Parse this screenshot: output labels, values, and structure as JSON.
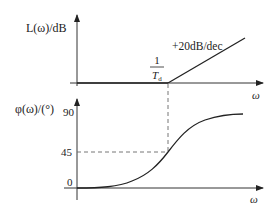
{
  "diagram": {
    "type": "bode-plot",
    "magnitude_plot": {
      "y_label": "L(ω)/dB",
      "x_label": "ω",
      "corner_label_numerator": "1",
      "corner_label_denominator": "T",
      "corner_label_subscript": "d",
      "slope_label": "+20dB/dec"
    },
    "phase_plot": {
      "y_label": "φ(ω)/(°)",
      "x_label": "ω",
      "ticks": [
        "90",
        "45",
        "0"
      ]
    },
    "colors": {
      "line": "#222222",
      "dashed": "#666666",
      "background": "#ffffff"
    }
  }
}
